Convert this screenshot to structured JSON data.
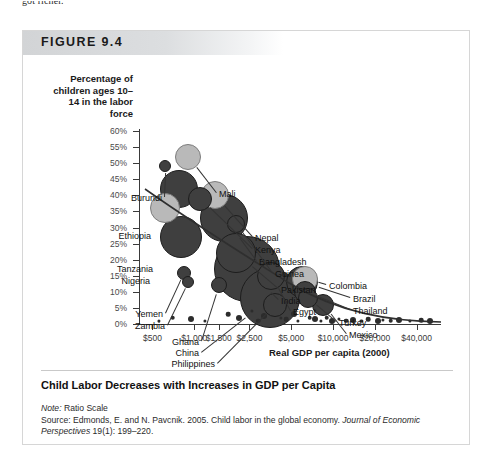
{
  "page": {
    "top_cut_text": "got richer."
  },
  "figure": {
    "number_label": "FIGURE 9.4",
    "caption": "Child Labor Decreases with Increases in GDP per Capita",
    "note_label": "Note:",
    "note_text": " Ratio Scale",
    "source_label": "Source:",
    "source_text": " Edmonds, E. and N. Pavcnik. 2005. Child labor in the global economy. ",
    "source_journal": "Journal of Economic Perspectives",
    "source_tail": " 19(1): 199–220."
  },
  "chart_data": {
    "type": "scatter",
    "title": "Child Labor Decreases with Increases in GDP per Capita",
    "xlabel": "Real GDP per capita (2000)",
    "ylabel": "Percentage of children ages 10–14 in the labor force",
    "xscale": "log",
    "note": "Ratio Scale",
    "grid": false,
    "legend": "none",
    "xlim": [
      400,
      60000
    ],
    "ylim": [
      0,
      60
    ],
    "xticks": [
      "$500",
      "$1,000",
      "$1,500",
      "$2,500",
      "$5,000",
      "$10,000",
      "$20,000",
      "$40,000"
    ],
    "xtick_values": [
      500,
      1000,
      1500,
      2500,
      5000,
      10000,
      20000,
      40000
    ],
    "yticks": [
      "0%",
      "5%",
      "10%",
      "15%",
      "20%",
      "25%",
      "30%",
      "35%",
      "40%",
      "45%",
      "50%",
      "55%",
      "60%"
    ],
    "ytick_values": [
      0,
      5,
      10,
      15,
      20,
      25,
      30,
      35,
      40,
      45,
      50,
      55,
      60
    ],
    "bubble_size_encodes": "population",
    "points": [
      {
        "name": "Burundi",
        "x": 620,
        "y": 49,
        "r": 6,
        "shade": "dark",
        "labeled": true
      },
      {
        "name": "Mali",
        "x": 900,
        "y": 52,
        "r": 13,
        "shade": "light",
        "labeled": true
      },
      {
        "name": "Ethiopia",
        "x": 780,
        "y": 42,
        "r": 19,
        "shade": "dark",
        "labeled": true
      },
      {
        "name": "Nepal",
        "x": 1400,
        "y": 40,
        "r": 14,
        "shade": "light",
        "labeled": true
      },
      {
        "name": "Kenya",
        "x": 1100,
        "y": 39,
        "r": 12,
        "shade": "dark",
        "labeled": true
      },
      {
        "name": "Tanzania",
        "x": 620,
        "y": 36,
        "r": 15,
        "shade": "light",
        "labeled": true
      },
      {
        "name": "Bangladesh",
        "x": 1650,
        "y": 33,
        "r": 24,
        "shade": "dark",
        "labeled": true
      },
      {
        "name": "Guinea",
        "x": 2000,
        "y": 31,
        "r": 9,
        "shade": "dark",
        "labeled": true
      },
      {
        "name": "Nigeria",
        "x": 800,
        "y": 27,
        "r": 21,
        "shade": "dark",
        "labeled": true
      },
      {
        "name": "Pakistan",
        "x": 2000,
        "y": 22,
        "r": 20,
        "shade": "dark",
        "labeled": true
      },
      {
        "name": "India",
        "x": 2400,
        "y": 17,
        "r": 33,
        "shade": "dark",
        "labeled": true
      },
      {
        "name": "Egypt",
        "x": 3600,
        "y": 15,
        "r": 14,
        "shade": "dark",
        "labeled": true
      },
      {
        "name": "Yemen",
        "x": 840,
        "y": 16,
        "r": 7,
        "shade": "dark",
        "labeled": true
      },
      {
        "name": "Zambia",
        "x": 900,
        "y": 13,
        "r": 6,
        "shade": "dark",
        "labeled": true
      },
      {
        "name": "Ghana",
        "x": 1500,
        "y": 12,
        "r": 8,
        "shade": "dark",
        "labeled": true
      },
      {
        "name": "China",
        "x": 3500,
        "y": 8,
        "r": 30,
        "shade": "dark",
        "labeled": true
      },
      {
        "name": "Philippines",
        "x": 3800,
        "y": 6,
        "r": 12,
        "shade": "dark",
        "labeled": true
      },
      {
        "name": "Colombia",
        "x": 6300,
        "y": 14,
        "r": 13,
        "shade": "light",
        "labeled": true
      },
      {
        "name": "Brazil",
        "x": 6000,
        "y": 13,
        "r": 16,
        "shade": "dark",
        "labeled": true
      },
      {
        "name": "Thailand",
        "x": 6300,
        "y": 10,
        "r": 11,
        "shade": "dark",
        "labeled": true
      },
      {
        "name": "Turkey",
        "x": 6600,
        "y": 8,
        "r": 10,
        "shade": "dark",
        "labeled": true
      },
      {
        "name": "Mexico",
        "x": 8500,
        "y": 6,
        "r": 11,
        "shade": "dark",
        "labeled": true
      }
    ],
    "trend_description": "Downward-sloping fitted curve from roughly 45% near $600 to near 0% above $20,000"
  }
}
